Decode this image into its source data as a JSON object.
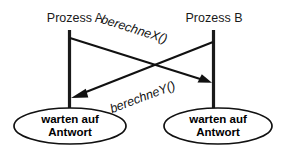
{
  "diagram": {
    "background_color": "#ffffff",
    "stroke_color": "#111111",
    "participants": [
      {
        "id": "a",
        "label": "Prozess A"
      },
      {
        "id": "b",
        "label": "Prozess B"
      }
    ],
    "messages": [
      {
        "id": "x",
        "label": "berechneX()",
        "from": "a",
        "to": "b"
      },
      {
        "id": "y",
        "label": "berechneY()",
        "from": "b",
        "to": "a"
      }
    ],
    "states": [
      {
        "id": "a",
        "line1": "warten auf",
        "line2": "Antwort"
      },
      {
        "id": "b",
        "line1": "warten auf",
        "line2": "Antwort"
      }
    ]
  }
}
